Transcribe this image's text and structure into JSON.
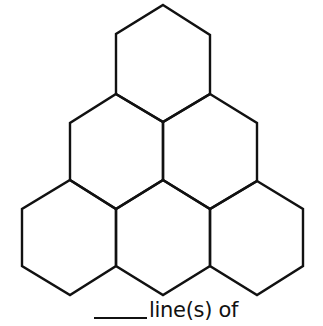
{
  "figure": {
    "hexagons": [
      {
        "row": "top",
        "points": "163,5 210,35 210,94 163,122 116,94 116,34"
      },
      {
        "row": "middle-left",
        "points": "116,94 163,122 163,180 116,209 70,180 70,123"
      },
      {
        "row": "middle-right",
        "points": "210,94 257,123 257,181 210,209 163,180 163,122"
      },
      {
        "row": "bottom-left",
        "points": "70,180 116,209 116,266 70,295 22,266 22,209"
      },
      {
        "row": "bottom-middle",
        "points": "163,180 210,209 210,266 163,295 116,266 116,209"
      },
      {
        "row": "bottom-right",
        "points": "257,181 303,209 303,266 257,295 210,266 210,209"
      }
    ],
    "stroke_color": "#111111"
  },
  "caption": {
    "blank": "",
    "text": "line(s) of"
  }
}
